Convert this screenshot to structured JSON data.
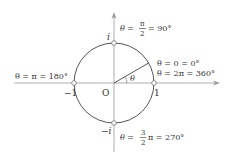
{
  "diagram": {
    "colors": {
      "axis": "#888888",
      "circle": "#555555",
      "text": "#333333",
      "point_fill": "#ffffff"
    },
    "origin_label": "O",
    "angle_label": "θ",
    "points": {
      "top": "i",
      "bottom": "−i",
      "left": "−1",
      "right": "1"
    },
    "annotations": {
      "top": {
        "prefix": "θ =",
        "numerator": "π",
        "denominator": "2",
        "suffix": "= 90°"
      },
      "right_line1": "θ = 0 = 0°",
      "right_line2": "θ = 2π = 360°",
      "left": "θ = π = 180°",
      "bottom": {
        "prefix": "θ =",
        "numerator": "3",
        "denominator": "2",
        "suffix": "π = 270°"
      }
    }
  }
}
